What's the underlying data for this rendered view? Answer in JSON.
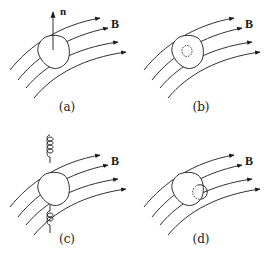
{
  "figure": {
    "panels": [
      {
        "id": "a",
        "caption": "(a)",
        "field_label": "B",
        "normal_label": "n",
        "feature": "normal-vector"
      },
      {
        "id": "b",
        "caption": "(b)",
        "field_label": "B",
        "feature": "dashed-inner-circle"
      },
      {
        "id": "c",
        "caption": "(c)",
        "field_label": "B",
        "feature": "helical-coil"
      },
      {
        "id": "d",
        "caption": "(d)",
        "field_label": "B",
        "feature": "dashed-edge-circle"
      }
    ],
    "colors": {
      "stroke": "#1a1a1a",
      "background": "#ffffff"
    }
  }
}
